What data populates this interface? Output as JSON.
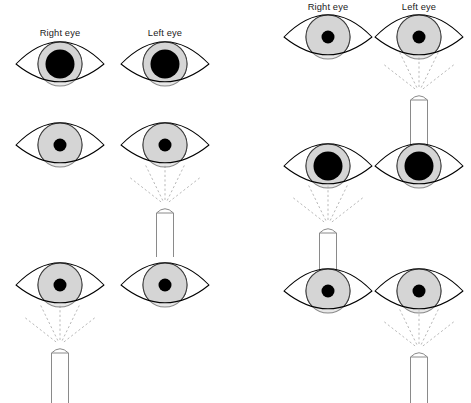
{
  "figure": {
    "type": "medical-diagram",
    "width": 471,
    "height": 403,
    "background_color": "#ffffff",
    "colors": {
      "iris": "#d5d5d5",
      "pupil": "#000000",
      "outline": "#000000",
      "torch": "#8a8a8a",
      "ray": "#b9b9b9",
      "label_text": "#1a1a1a"
    }
  },
  "panels": [
    {
      "id": "left-panel",
      "name": "normal-pupillary-response",
      "labels": {
        "right_eye": "Right eye",
        "left_eye": "Left eye"
      },
      "label_positions": {
        "right_eye_x": 60,
        "left_eye_x": 165,
        "y": 36
      },
      "columns": {
        "right_eye_cx": 60,
        "left_eye_cx": 165
      },
      "rows": [
        {
          "id": "left-row-1",
          "name": "no-light-baseline",
          "cy": 64,
          "light": "none",
          "eyes": [
            {
              "side": "right",
              "cx": 60,
              "pupil_state": "dilated",
              "pupil_r": 14.5,
              "iris_r": 22
            },
            {
              "side": "left",
              "cx": 165,
              "pupil_state": "dilated",
              "pupil_r": 14.5,
              "iris_r": 22
            }
          ]
        },
        {
          "id": "left-row-2",
          "name": "light-on-left-eye",
          "cy": 145,
          "light": "left",
          "torch": {
            "cx": 165,
            "top_y": 206,
            "bottom_y": 257,
            "width": 17
          },
          "eyes": [
            {
              "side": "right",
              "cx": 60,
              "pupil_state": "constricted",
              "pupil_r": 6.5,
              "iris_r": 22
            },
            {
              "side": "left",
              "cx": 165,
              "pupil_state": "constricted",
              "pupil_r": 6.5,
              "iris_r": 22
            }
          ]
        },
        {
          "id": "left-row-3",
          "name": "light-on-right-eye",
          "cy": 285,
          "light": "right",
          "torch": {
            "cx": 60,
            "top_y": 346,
            "bottom_y": 403,
            "width": 17
          },
          "eyes": [
            {
              "side": "right",
              "cx": 60,
              "pupil_state": "constricted",
              "pupil_r": 6.5,
              "iris_r": 22
            },
            {
              "side": "left",
              "cx": 165,
              "pupil_state": "constricted",
              "pupil_r": 6.5,
              "iris_r": 22
            }
          ]
        }
      ]
    },
    {
      "id": "right-panel",
      "name": "relative-afferent-pupillary-defect",
      "labels": {
        "right_eye": "Right eye",
        "left_eye": "Left eye"
      },
      "label_positions": {
        "right_eye_x": 328,
        "left_eye_x": 419,
        "y": 10
      },
      "columns": {
        "right_eye_cx": 328,
        "left_eye_cx": 419
      },
      "rows": [
        {
          "id": "right-row-1",
          "name": "light-on-left-eye-constricted",
          "cy": 37,
          "light": "left",
          "torch": {
            "cx": 419,
            "top_y": 93,
            "bottom_y": 145,
            "width": 17
          },
          "eyes": [
            {
              "side": "right",
              "cx": 328,
              "pupil_state": "constricted",
              "pupil_r": 6.5,
              "iris_r": 22
            },
            {
              "side": "left",
              "cx": 419,
              "pupil_state": "constricted",
              "pupil_r": 6.5,
              "iris_r": 22
            }
          ]
        },
        {
          "id": "right-row-2",
          "name": "light-on-right-eye-dilated",
          "cy": 166,
          "light": "right",
          "torch": {
            "cx": 328,
            "top_y": 226,
            "bottom_y": 278,
            "width": 17
          },
          "eyes": [
            {
              "side": "right",
              "cx": 328,
              "pupil_state": "dilated",
              "pupil_r": 14.5,
              "iris_r": 22
            },
            {
              "side": "left",
              "cx": 419,
              "pupil_state": "dilated",
              "pupil_r": 14.5,
              "iris_r": 22
            }
          ]
        },
        {
          "id": "right-row-3",
          "name": "light-back-on-left-eye-constricted",
          "cy": 291,
          "light": "left",
          "torch": {
            "cx": 419,
            "top_y": 350,
            "bottom_y": 403,
            "width": 17
          },
          "eyes": [
            {
              "side": "right",
              "cx": 328,
              "pupil_state": "constricted",
              "pupil_r": 6.5,
              "iris_r": 22
            },
            {
              "side": "left",
              "cx": 419,
              "pupil_state": "constricted",
              "pupil_r": 6.5,
              "iris_r": 22
            }
          ]
        }
      ]
    }
  ],
  "geometry": {
    "eye_half_width": 44,
    "eye_half_height": 22,
    "ray_count": 5,
    "ray_length": 44,
    "ray_angles_deg": [
      -52,
      -26,
      0,
      26,
      52
    ]
  }
}
